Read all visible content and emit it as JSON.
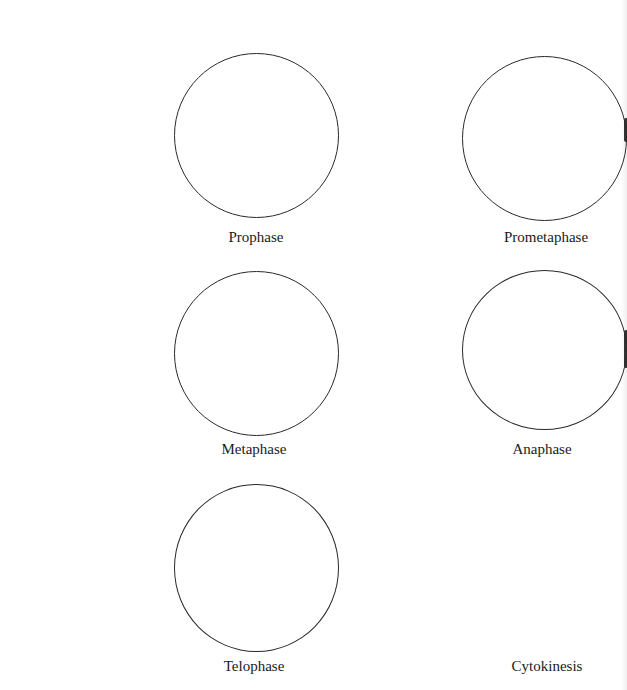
{
  "worksheet": {
    "phases": [
      {
        "label": "Prophase"
      },
      {
        "label": "Prometaphase"
      },
      {
        "label": "Metaphase"
      },
      {
        "label": "Anaphase"
      },
      {
        "label": "Telophase"
      },
      {
        "label": "Cytokinesis"
      }
    ]
  }
}
